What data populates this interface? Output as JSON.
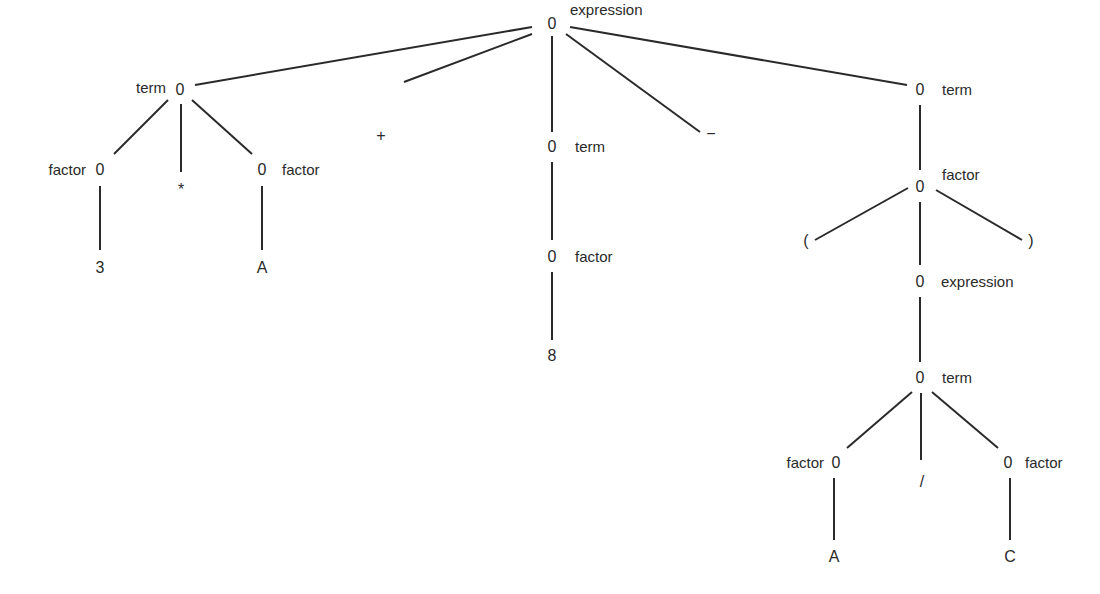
{
  "diagram": {
    "type": "parse-tree",
    "node_symbol": "0",
    "nodes": [
      {
        "id": "root",
        "x": 552,
        "y": 24,
        "text": "0",
        "tag": "expression",
        "tag_pos": "above",
        "tag_x": 570,
        "tag_y": 10
      },
      {
        "id": "t1",
        "x": 180,
        "y": 90,
        "text": "0",
        "tag": "term",
        "tag_pos": "left",
        "tag_x": 166,
        "tag_y": 88
      },
      {
        "id": "f1",
        "x": 100,
        "y": 170,
        "text": "0",
        "tag": "factor",
        "tag_pos": "left",
        "tag_x": 86,
        "tag_y": 170
      },
      {
        "id": "star",
        "x": 181,
        "y": 190,
        "text": "*",
        "tag": "",
        "tag_pos": "none",
        "tag_x": 0,
        "tag_y": 0
      },
      {
        "id": "f2",
        "x": 262,
        "y": 170,
        "text": "0",
        "tag": "factor",
        "tag_pos": "right",
        "tag_x": 282,
        "tag_y": 170
      },
      {
        "id": "l3",
        "x": 100,
        "y": 268,
        "text": "3",
        "tag": "",
        "tag_pos": "none",
        "tag_x": 0,
        "tag_y": 0
      },
      {
        "id": "lA1",
        "x": 262,
        "y": 268,
        "text": "A",
        "tag": "",
        "tag_pos": "none",
        "tag_x": 0,
        "tag_y": 0
      },
      {
        "id": "plus",
        "x": 381,
        "y": 136,
        "text": "+",
        "tag": "",
        "tag_pos": "none",
        "tag_x": 0,
        "tag_y": 0
      },
      {
        "id": "minus",
        "x": 711,
        "y": 134,
        "text": "−",
        "tag": "",
        "tag_pos": "none",
        "tag_x": 0,
        "tag_y": 0
      },
      {
        "id": "t2",
        "x": 552,
        "y": 147,
        "text": "0",
        "tag": "term",
        "tag_pos": "right",
        "tag_x": 575,
        "tag_y": 147
      },
      {
        "id": "f3",
        "x": 552,
        "y": 257,
        "text": "0",
        "tag": "factor",
        "tag_pos": "right",
        "tag_x": 575,
        "tag_y": 257
      },
      {
        "id": "l8",
        "x": 552,
        "y": 356,
        "text": "8",
        "tag": "",
        "tag_pos": "none",
        "tag_x": 0,
        "tag_y": 0
      },
      {
        "id": "t3",
        "x": 920,
        "y": 90,
        "text": "0",
        "tag": "term",
        "tag_pos": "right",
        "tag_x": 942,
        "tag_y": 90
      },
      {
        "id": "f4",
        "x": 920,
        "y": 187,
        "text": "0",
        "tag": "factor",
        "tag_pos": "above",
        "tag_x": 942,
        "tag_y": 175
      },
      {
        "id": "lparen",
        "x": 806,
        "y": 241,
        "text": "(",
        "tag": "",
        "tag_pos": "none",
        "tag_x": 0,
        "tag_y": 0
      },
      {
        "id": "rparen",
        "x": 1031,
        "y": 241,
        "text": ")",
        "tag": "",
        "tag_pos": "none",
        "tag_x": 0,
        "tag_y": 0
      },
      {
        "id": "e2",
        "x": 920,
        "y": 282,
        "text": "0",
        "tag": "expression",
        "tag_pos": "right",
        "tag_x": 941,
        "tag_y": 282
      },
      {
        "id": "t4",
        "x": 920,
        "y": 378,
        "text": "0",
        "tag": "term",
        "tag_pos": "right",
        "tag_x": 942,
        "tag_y": 378
      },
      {
        "id": "f5",
        "x": 836,
        "y": 463,
        "text": "0",
        "tag": "factor",
        "tag_pos": "left",
        "tag_x": 824,
        "tag_y": 463
      },
      {
        "id": "slash",
        "x": 922,
        "y": 482,
        "text": "/",
        "tag": "",
        "tag_pos": "none",
        "tag_x": 0,
        "tag_y": 0
      },
      {
        "id": "f6",
        "x": 1008,
        "y": 463,
        "text": "0",
        "tag": "factor",
        "tag_pos": "right",
        "tag_x": 1025,
        "tag_y": 463
      },
      {
        "id": "lA2",
        "x": 834,
        "y": 557,
        "text": "A",
        "tag": "",
        "tag_pos": "none",
        "tag_x": 0,
        "tag_y": 0
      },
      {
        "id": "lC",
        "x": 1010,
        "y": 557,
        "text": "C",
        "tag": "",
        "tag_pos": "none",
        "tag_x": 0,
        "tag_y": 0
      }
    ],
    "edges": [
      [
        532,
        27,
        195,
        85
      ],
      [
        532,
        34,
        404,
        82
      ],
      [
        552,
        36,
        552,
        132
      ],
      [
        566,
        34,
        700,
        132
      ],
      [
        570,
        27,
        907,
        85
      ],
      [
        168,
        100,
        114,
        154
      ],
      [
        181,
        104,
        181,
        172
      ],
      [
        192,
        100,
        252,
        154
      ],
      [
        100,
        186,
        100,
        250
      ],
      [
        262,
        186,
        262,
        250
      ],
      [
        552,
        162,
        552,
        240
      ],
      [
        552,
        272,
        552,
        340
      ],
      [
        920,
        105,
        920,
        170
      ],
      [
        908,
        188,
        815,
        240
      ],
      [
        936,
        190,
        1022,
        240
      ],
      [
        920,
        202,
        920,
        265
      ],
      [
        920,
        297,
        920,
        362
      ],
      [
        912,
        392,
        847,
        448
      ],
      [
        921,
        393,
        921,
        460
      ],
      [
        932,
        392,
        998,
        448
      ],
      [
        834,
        478,
        834,
        540
      ],
      [
        1010,
        478,
        1010,
        540
      ]
    ]
  }
}
